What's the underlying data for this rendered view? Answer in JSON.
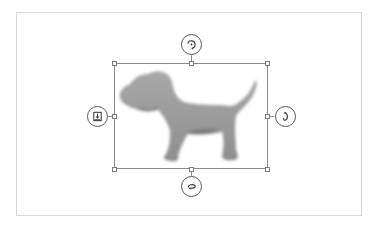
{
  "canvas": {
    "background": "#ffffff",
    "frame_border_color": "#d6d6d6"
  },
  "selection": {
    "object": "dog-silhouette-image",
    "border_color": "#8a8a8a",
    "handles": [
      "top-left",
      "top-center",
      "top-right",
      "middle-left",
      "middle-right",
      "bottom-left",
      "bottom-center",
      "bottom-right"
    ]
  },
  "controls": {
    "top": {
      "icon": "rotate-clockwise-icon"
    },
    "left": {
      "icon": "flip-download-icon"
    },
    "right": {
      "icon": "rotate-right-icon"
    },
    "bottom": {
      "icon": "flip-horizontal-icon"
    }
  },
  "image": {
    "subject": "dog",
    "fill_color": "#9a9a9a",
    "shadow_color": "#6f6f6f"
  }
}
